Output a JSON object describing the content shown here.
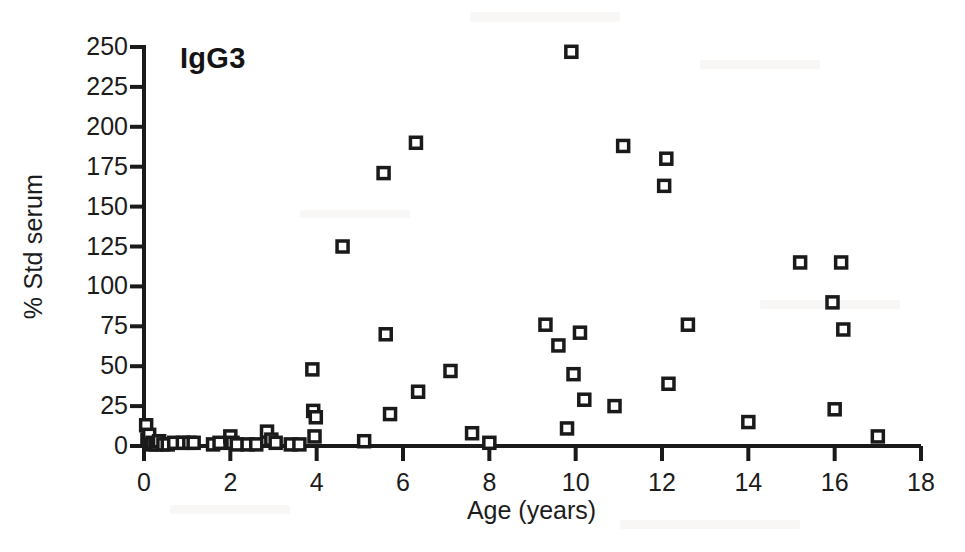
{
  "chart_data": {
    "type": "scatter",
    "title": "IgG3",
    "xlabel": "Age (years)",
    "ylabel": "% Std serum",
    "xlim": [
      0,
      18
    ],
    "ylim": [
      0,
      250
    ],
    "xticks": [
      0,
      2,
      4,
      6,
      8,
      10,
      12,
      14,
      16,
      18
    ],
    "yticks": [
      0,
      25,
      50,
      75,
      100,
      125,
      150,
      175,
      200,
      225,
      250
    ],
    "grid": false,
    "legend": null,
    "marker": "open-square",
    "series": [
      {
        "name": "IgG3 serum concentration",
        "points": [
          [
            0.05,
            13
          ],
          [
            0.08,
            4
          ],
          [
            0.12,
            7
          ],
          [
            0.15,
            1
          ],
          [
            0.2,
            2
          ],
          [
            0.28,
            1
          ],
          [
            0.35,
            3
          ],
          [
            0.45,
            1
          ],
          [
            0.55,
            1
          ],
          [
            0.7,
            2
          ],
          [
            0.9,
            2
          ],
          [
            1.05,
            2
          ],
          [
            1.15,
            2
          ],
          [
            1.6,
            1
          ],
          [
            1.75,
            2
          ],
          [
            2.0,
            6
          ],
          [
            2.05,
            2
          ],
          [
            2.15,
            1
          ],
          [
            2.4,
            1
          ],
          [
            2.6,
            1
          ],
          [
            2.85,
            9
          ],
          [
            2.95,
            4
          ],
          [
            3.05,
            2
          ],
          [
            3.4,
            1
          ],
          [
            3.6,
            1
          ],
          [
            3.9,
            48
          ],
          [
            3.92,
            22
          ],
          [
            3.98,
            18
          ],
          [
            3.95,
            6
          ],
          [
            4.6,
            125
          ],
          [
            5.1,
            3
          ],
          [
            5.55,
            171
          ],
          [
            5.6,
            70
          ],
          [
            5.7,
            20
          ],
          [
            6.3,
            190
          ],
          [
            6.35,
            34
          ],
          [
            7.1,
            47
          ],
          [
            7.6,
            8
          ],
          [
            8.0,
            2
          ],
          [
            9.3,
            76
          ],
          [
            9.6,
            63
          ],
          [
            9.8,
            11
          ],
          [
            9.9,
            247
          ],
          [
            9.95,
            45
          ],
          [
            10.1,
            71
          ],
          [
            10.2,
            29
          ],
          [
            10.9,
            25
          ],
          [
            11.1,
            188
          ],
          [
            12.05,
            163
          ],
          [
            12.1,
            180
          ],
          [
            12.15,
            39
          ],
          [
            12.6,
            76
          ],
          [
            14.0,
            15
          ],
          [
            15.2,
            115
          ],
          [
            15.95,
            90
          ],
          [
            16.0,
            23
          ],
          [
            16.15,
            115
          ],
          [
            16.2,
            73
          ],
          [
            17.0,
            6
          ]
        ]
      }
    ]
  },
  "colors": {
    "marker_edge": "#1a1a1a",
    "marker_fill": "#ffffff",
    "axis": "#1a1a1a",
    "text": "#1c1c1c",
    "background": "#ffffff"
  }
}
